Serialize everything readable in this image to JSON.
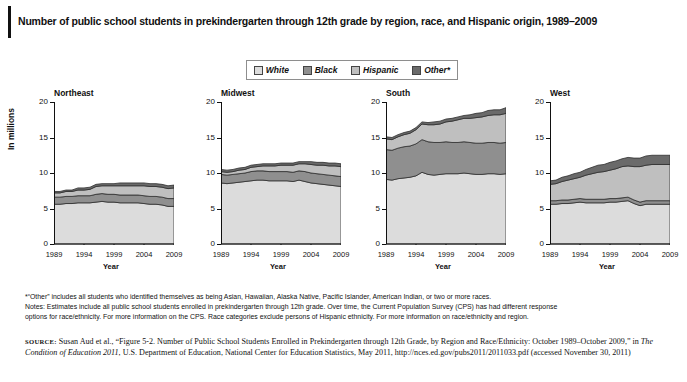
{
  "title": "Number of public school students in prekindergarten through 12th grade by region, race, and Hispanic origin, 1989–2009",
  "legend": {
    "items": [
      {
        "label": "White",
        "color": "#dcdcdc"
      },
      {
        "label": "Black",
        "color": "#8f8f8f"
      },
      {
        "label": "Hispanic",
        "color": "#bfbfbf"
      },
      {
        "label": "Other*",
        "color": "#6a6a6a"
      }
    ]
  },
  "axes": {
    "ylabel": "In millions",
    "xlabel": "Year",
    "yticks": [
      "0",
      "5",
      "10",
      "15",
      "20"
    ],
    "xticks": [
      "1989",
      "1994",
      "1999",
      "2004",
      "2009"
    ],
    "ylim": [
      0,
      20
    ],
    "xlim": [
      1989,
      2009
    ]
  },
  "notes": {
    "line1": "*“Other” includes all students who identified themselves as being Asian, Hawaiian, Alaska Native, Pacific Islander, American Indian, or two or more races.",
    "line2": "Notes: Estimates include all public school students enrolled in prekindergarten through 12th grade. Over time, the Current Population Survey (CPS) has had different response",
    "line3": "options for race/ethnicity. For more information on the CPS. Race categories exclude persons of Hispanic ethnicity. For more information on race/ethnicity and region."
  },
  "source": {
    "label": "SOURCE:",
    "part1": " Susan Aud et al., “Figure 5-2. Number of Public School Students Enrolled in Prekindergarten through 12th Grade, by Region and Race/Ethnicity: October 1989–October 2009,” in ",
    "italic1": "The Condition of Education 2011",
    "part2": ", U.S. Department of Education, National Center for Education Statistics, May 2011, http://nces.ed.gov/pubs2011/2011033.pdf (accessed November 30, 2011)"
  },
  "chart_data": {
    "type": "area",
    "title": "Number of public school students in prekindergarten through 12th grade by region, race, and Hispanic origin, 1989–2009",
    "xlabel": "Year",
    "ylabel": "In millions",
    "ylim": [
      0,
      20
    ],
    "xlim": [
      1989,
      2009
    ],
    "grid": false,
    "legend_position": "top-center",
    "stacked": true,
    "stack_order": [
      "White",
      "Black",
      "Hispanic",
      "Other*"
    ],
    "x": [
      1989,
      1990,
      1991,
      1992,
      1993,
      1994,
      1995,
      1996,
      1997,
      1998,
      1999,
      2000,
      2001,
      2002,
      2003,
      2004,
      2005,
      2006,
      2007,
      2008,
      2009
    ],
    "panels": [
      {
        "name": "Northeast",
        "series": [
          {
            "name": "White",
            "values": [
              5.6,
              5.6,
              5.7,
              5.7,
              5.8,
              5.8,
              5.8,
              5.9,
              6.0,
              5.9,
              5.9,
              5.8,
              5.8,
              5.8,
              5.8,
              5.7,
              5.6,
              5.6,
              5.5,
              5.3,
              5.3
            ]
          },
          {
            "name": "Black",
            "values": [
              1.0,
              1.0,
              1.0,
              1.0,
              1.0,
              1.0,
              1.0,
              1.1,
              1.1,
              1.1,
              1.1,
              1.1,
              1.1,
              1.1,
              1.1,
              1.1,
              1.1,
              1.1,
              1.1,
              1.1,
              1.1
            ]
          },
          {
            "name": "Hispanic",
            "values": [
              0.6,
              0.6,
              0.7,
              0.7,
              0.8,
              0.8,
              0.9,
              1.1,
              1.1,
              1.2,
              1.2,
              1.3,
              1.3,
              1.3,
              1.3,
              1.4,
              1.4,
              1.4,
              1.4,
              1.4,
              1.5
            ]
          },
          {
            "name": "Other*",
            "values": [
              0.2,
              0.2,
              0.2,
              0.2,
              0.3,
              0.3,
              0.3,
              0.3,
              0.3,
              0.3,
              0.3,
              0.4,
              0.4,
              0.4,
              0.4,
              0.4,
              0.4,
              0.4,
              0.4,
              0.4,
              0.4
            ]
          }
        ],
        "totals": [
          7.4,
          7.4,
          7.6,
          7.6,
          7.9,
          7.9,
          8.0,
          8.4,
          8.5,
          8.5,
          8.5,
          8.6,
          8.6,
          8.6,
          8.6,
          8.6,
          8.5,
          8.5,
          8.4,
          8.2,
          8.3
        ]
      },
      {
        "name": "Midwest",
        "series": [
          {
            "name": "White",
            "values": [
              8.6,
              8.5,
              8.6,
              8.7,
              8.8,
              8.9,
              9.0,
              9.0,
              8.9,
              8.9,
              8.9,
              8.9,
              8.8,
              9.0,
              8.8,
              8.6,
              8.5,
              8.4,
              8.3,
              8.2,
              8.1
            ]
          },
          {
            "name": "Black",
            "values": [
              1.2,
              1.2,
              1.2,
              1.2,
              1.2,
              1.3,
              1.3,
              1.3,
              1.3,
              1.3,
              1.3,
              1.3,
              1.3,
              1.3,
              1.4,
              1.4,
              1.4,
              1.4,
              1.4,
              1.4,
              1.4
            ]
          },
          {
            "name": "Hispanic",
            "values": [
              0.4,
              0.4,
              0.4,
              0.5,
              0.5,
              0.6,
              0.6,
              0.7,
              0.8,
              0.8,
              0.9,
              0.9,
              1.0,
              1.0,
              1.1,
              1.2,
              1.2,
              1.3,
              1.3,
              1.4,
              1.4
            ]
          },
          {
            "name": "Other*",
            "values": [
              0.3,
              0.3,
              0.3,
              0.3,
              0.3,
              0.3,
              0.3,
              0.3,
              0.3,
              0.3,
              0.3,
              0.3,
              0.3,
              0.3,
              0.3,
              0.4,
              0.4,
              0.4,
              0.4,
              0.4,
              0.4
            ]
          }
        ],
        "totals": [
          10.5,
          10.4,
          10.5,
          10.7,
          10.8,
          11.1,
          11.2,
          11.3,
          11.3,
          11.3,
          11.4,
          11.4,
          11.4,
          11.6,
          11.6,
          11.6,
          11.5,
          11.5,
          11.4,
          11.4,
          11.3
        ]
      },
      {
        "name": "South",
        "series": [
          {
            "name": "White",
            "values": [
              9.1,
              9.0,
              9.2,
              9.3,
              9.4,
              9.6,
              10.1,
              9.8,
              9.7,
              9.8,
              9.9,
              9.9,
              9.9,
              10.0,
              9.9,
              9.8,
              9.8,
              9.9,
              9.9,
              9.8,
              9.9
            ]
          },
          {
            "name": "Black",
            "values": [
              4.2,
              4.2,
              4.3,
              4.4,
              4.4,
              4.5,
              4.6,
              4.6,
              4.6,
              4.5,
              4.5,
              4.4,
              4.4,
              4.4,
              4.4,
              4.4,
              4.4,
              4.4,
              4.4,
              4.4,
              4.4
            ]
          },
          {
            "name": "Hispanic",
            "values": [
              1.5,
              1.5,
              1.6,
              1.7,
              1.8,
              2.0,
              2.2,
              2.4,
              2.5,
              2.6,
              2.8,
              3.0,
              3.2,
              3.3,
              3.4,
              3.6,
              3.7,
              3.8,
              3.9,
              4.0,
              4.1
            ]
          },
          {
            "name": "Other*",
            "values": [
              0.3,
              0.3,
              0.3,
              0.3,
              0.3,
              0.3,
              0.3,
              0.3,
              0.4,
              0.4,
              0.4,
              0.4,
              0.4,
              0.4,
              0.5,
              0.6,
              0.6,
              0.7,
              0.7,
              0.7,
              0.8
            ]
          }
        ],
        "totals": [
          15.1,
          15.0,
          15.4,
          15.7,
          15.9,
          16.4,
          17.2,
          17.1,
          17.2,
          17.3,
          17.6,
          17.7,
          17.9,
          18.1,
          18.2,
          18.4,
          18.5,
          18.8,
          18.9,
          18.9,
          19.2
        ]
      },
      {
        "name": "West",
        "series": [
          {
            "name": "White",
            "values": [
              5.6,
              5.6,
              5.7,
              5.7,
              5.8,
              5.9,
              5.8,
              5.8,
              5.8,
              5.8,
              5.9,
              5.9,
              6.0,
              6.1,
              5.7,
              5.4,
              5.6,
              5.6,
              5.6,
              5.6,
              5.6
            ]
          },
          {
            "name": "Black",
            "values": [
              0.5,
              0.5,
              0.5,
              0.5,
              0.5,
              0.5,
              0.5,
              0.5,
              0.5,
              0.5,
              0.5,
              0.5,
              0.5,
              0.5,
              0.5,
              0.5,
              0.5,
              0.5,
              0.5,
              0.5,
              0.5
            ]
          },
          {
            "name": "Hispanic",
            "values": [
              2.3,
              2.4,
              2.6,
              2.8,
              2.9,
              3.0,
              3.4,
              3.6,
              3.8,
              3.9,
              4.0,
              4.2,
              4.4,
              4.4,
              4.7,
              5.0,
              5.0,
              5.1,
              5.1,
              5.1,
              5.1
            ]
          },
          {
            "name": "Other*",
            "values": [
              0.5,
              0.5,
              0.6,
              0.6,
              0.7,
              0.7,
              0.8,
              0.9,
              1.0,
              1.0,
              1.1,
              1.1,
              1.1,
              1.2,
              1.2,
              1.2,
              1.3,
              1.3,
              1.3,
              1.3,
              1.3
            ]
          }
        ],
        "totals": [
          8.9,
          9.0,
          9.4,
          9.6,
          9.9,
          10.1,
          10.5,
          10.8,
          11.1,
          11.2,
          11.5,
          11.7,
          12.0,
          12.2,
          12.1,
          12.1,
          12.4,
          12.5,
          12.5,
          12.5,
          12.5
        ]
      }
    ]
  }
}
